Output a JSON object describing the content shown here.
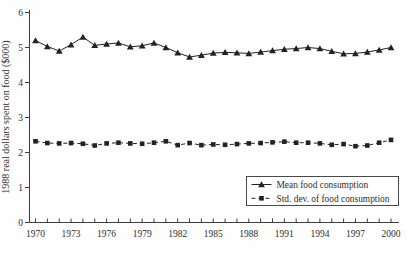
{
  "chart_data": {
    "type": "line",
    "title": "",
    "xlabel": "",
    "ylabel": "1988 real dollars spent on food ($000)",
    "x": [
      1970,
      1971,
      1972,
      1973,
      1974,
      1975,
      1976,
      1977,
      1978,
      1979,
      1980,
      1981,
      1982,
      1983,
      1984,
      1985,
      1986,
      1987,
      1988,
      1989,
      1990,
      1991,
      1992,
      1993,
      1994,
      1995,
      1996,
      1997,
      1998,
      1999,
      2000
    ],
    "x_tick_labels": [
      1970,
      1973,
      1976,
      1979,
      1982,
      1985,
      1988,
      1991,
      1994,
      1997,
      2000
    ],
    "y_ticks": [
      0,
      1,
      2,
      3,
      4,
      5,
      6
    ],
    "ylim": [
      0,
      6
    ],
    "xlim": [
      1970,
      2000
    ],
    "grid": false,
    "legend_position": "inside-lower-right",
    "series": [
      {
        "name": "Mean food consumption",
        "marker": "triangle",
        "line_style": "solid",
        "values": [
          5.2,
          5.03,
          4.9,
          5.08,
          5.3,
          5.06,
          5.1,
          5.13,
          5.02,
          5.05,
          5.13,
          5.0,
          4.85,
          4.73,
          4.78,
          4.84,
          4.86,
          4.85,
          4.83,
          4.87,
          4.91,
          4.95,
          4.97,
          5.0,
          4.97,
          4.89,
          4.82,
          4.83,
          4.87,
          4.93,
          5.0
        ]
      },
      {
        "name": "Std. dev. of food consumption",
        "marker": "square",
        "line_style": "dashed",
        "values": [
          2.32,
          2.27,
          2.26,
          2.27,
          2.25,
          2.2,
          2.26,
          2.28,
          2.26,
          2.25,
          2.28,
          2.32,
          2.21,
          2.27,
          2.21,
          2.23,
          2.22,
          2.24,
          2.26,
          2.27,
          2.29,
          2.31,
          2.28,
          2.28,
          2.26,
          2.22,
          2.24,
          2.18,
          2.2,
          2.28,
          2.36
        ]
      }
    ],
    "colors": {
      "series_stroke": "#222222",
      "axis": "#3d3d3d",
      "text": "#2e2e2e",
      "legend_border": "#4a4a4a",
      "background": "#fefefe"
    }
  }
}
